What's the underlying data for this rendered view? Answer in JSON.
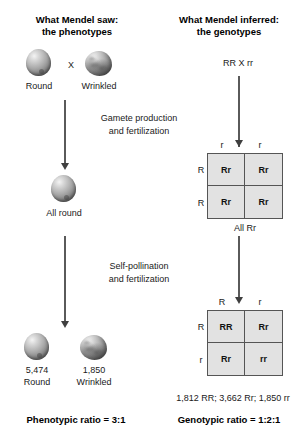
{
  "columns": {
    "left": {
      "heading_line1": "What Mendel saw:",
      "heading_line2": "the phenotypes"
    },
    "right": {
      "heading_line1": "What Mendel inferred:",
      "heading_line2": "the genotypes"
    }
  },
  "parents": {
    "round_label": "Round",
    "wrinkled_label": "Wrinkled",
    "cross_symbol": "X",
    "genotype_cross": "RR X rr"
  },
  "steps": {
    "step1_line1": "Gamete production",
    "step1_line2": "and fertilization",
    "step2_line1": "Self-pollination",
    "step2_line2": "and fertilization"
  },
  "f1": {
    "phenotype_label": "All round",
    "genotype_label": "All Rr"
  },
  "f2": {
    "round_count": "5,474",
    "round_label": "Round",
    "wrinkled_count": "1,850",
    "wrinkled_label": "Wrinkled",
    "genotype_counts": "1,812 RR; 3,662 Rr; 1,850 rr"
  },
  "ratios": {
    "phenotypic": "Phenotypic ratio = 3:1",
    "genotypic": "Genotypic ratio = 1:2:1"
  },
  "punnett1": {
    "col_headers": [
      "r",
      "r"
    ],
    "row_headers": [
      "R",
      "R"
    ],
    "cells": [
      "Rr",
      "Rr",
      "Rr",
      "Rr"
    ]
  },
  "punnett2": {
    "col_headers": [
      "R",
      "r"
    ],
    "row_headers": [
      "R",
      "r"
    ],
    "cells": [
      "RR",
      "Rr",
      "Rr",
      "rr"
    ]
  },
  "colors": {
    "square_fill": "#e2e2e2",
    "square_border": "#555555",
    "text": "#1a1a1a"
  }
}
